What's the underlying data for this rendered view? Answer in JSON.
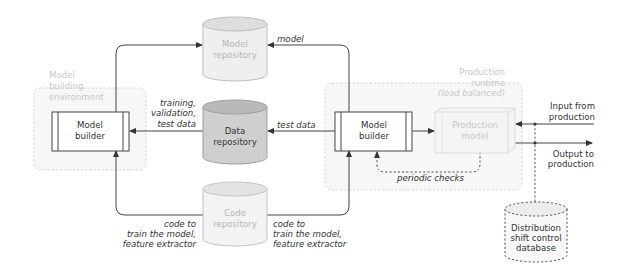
{
  "diagram": {
    "type": "ml-pipeline-architecture",
    "environments": {
      "model_building": {
        "label_lines": [
          "Model",
          "building",
          "environment"
        ]
      },
      "production_runtime": {
        "label_lines": [
          "Production",
          "runtime"
        ],
        "sublabel": "(load balanced)"
      }
    },
    "nodes": {
      "model_repository": {
        "label_lines": [
          "Model",
          "repository"
        ]
      },
      "data_repository": {
        "label_lines": [
          "Data",
          "repository"
        ]
      },
      "code_repository": {
        "label_lines": [
          "Code",
          "repository"
        ]
      },
      "model_builder_left": {
        "label_lines": [
          "Model",
          "builder"
        ]
      },
      "model_builder_right": {
        "label_lines": [
          "Model",
          "builder"
        ]
      },
      "production_model": {
        "label_lines": [
          "Production",
          "model"
        ]
      },
      "distribution_db": {
        "label_lines": [
          "Distribution",
          "shift control",
          "database"
        ]
      }
    },
    "edge_labels": {
      "model": "model",
      "training_data": [
        "training,",
        "validation,",
        "test data"
      ],
      "test_data": "test data",
      "code_left": [
        "code to",
        "train the model,",
        "feature extractor"
      ],
      "code_right": [
        "code to",
        "train the model,",
        "feature extractor"
      ],
      "periodic_checks": "periodic checks",
      "input": [
        "Input from",
        "production"
      ],
      "output": [
        "Output to",
        "production"
      ]
    },
    "colors": {
      "data_repo_fill": "#cfcfcf",
      "data_repo_top": "#b9b9b9",
      "repo_fill": "#efefef",
      "repo_top": "#dedede",
      "env_fill": "#f7f7f7",
      "env_stroke": "#d3d3d3",
      "line": "#444444"
    }
  }
}
